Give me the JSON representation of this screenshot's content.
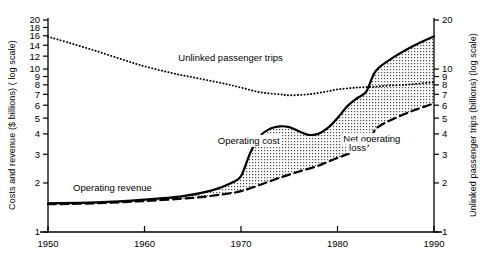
{
  "chart_data": {
    "type": "line",
    "title": "",
    "xlabel": "",
    "ylabel": "Costs and revenue ($ billions) ( log scale)",
    "y2label": "Unlinked passenger trips (billions) (log scale)",
    "grid": false,
    "legend_position": "inline-annotations",
    "xlim": [
      1950,
      1990
    ],
    "xticks": [
      1950,
      1960,
      1970,
      1980,
      1990
    ],
    "xtick_labels": [
      "1950",
      "1960",
      "1970",
      "1980",
      "1990"
    ],
    "yscale": "log",
    "ylim": [
      1,
      20
    ],
    "yticks": [
      1,
      2,
      3,
      4,
      5,
      6,
      7,
      8,
      9,
      10,
      12,
      14,
      16,
      18,
      20
    ],
    "ytick_labels": [
      "1",
      "2",
      "3",
      "4",
      "5",
      "6",
      "7",
      "8",
      "9",
      "10",
      "12",
      "14",
      "16",
      "18",
      "20"
    ],
    "y2scale": "log",
    "y2lim": [
      1,
      20
    ],
    "y2ticks": [
      1,
      2,
      3,
      4,
      5,
      6,
      7,
      8,
      9,
      10,
      20
    ],
    "y2tick_labels": [
      "1",
      "2",
      "3",
      "4",
      "5",
      "6",
      "7",
      "8",
      "9",
      "10",
      "20"
    ],
    "annotations": [
      {
        "text": "Unlinked passenger trips",
        "x": 1963.5,
        "y": 11.2
      },
      {
        "text": "Operating cost",
        "x": 1967.6,
        "y": 3.45
      },
      {
        "text": "Net operating",
        "x": 1980.6,
        "y": 3.55
      },
      {
        "text": "loss",
        "x": 1981.2,
        "y": 3.15
      },
      {
        "text": "Operating revenue",
        "x": 1952.6,
        "y": 1.78
      }
    ],
    "fill_label": "Net operating loss",
    "fill_between": [
      "Operating cost",
      "Operating revenue"
    ],
    "fill_style": "stippled",
    "series": [
      {
        "name": "Unlinked passenger trips",
        "style": "dotted",
        "axis": "right",
        "x": [
          1950,
          1952,
          1955,
          1958,
          1960,
          1963,
          1965,
          1968,
          1970,
          1972,
          1974,
          1975,
          1977,
          1979,
          1980,
          1982,
          1984,
          1985,
          1987,
          1989,
          1990
        ],
        "values": [
          15.8,
          14.6,
          12.9,
          11.3,
          10.4,
          9.4,
          8.9,
          8.2,
          7.7,
          7.2,
          7.0,
          6.9,
          7.0,
          7.3,
          7.5,
          7.7,
          7.8,
          7.9,
          8.0,
          8.2,
          8.3
        ]
      },
      {
        "name": "Operating cost",
        "style": "solid",
        "axis": "left",
        "x": [
          1950,
          1955,
          1960,
          1964,
          1967,
          1969,
          1970,
          1971,
          1972,
          1973,
          1974,
          1975,
          1976,
          1977,
          1978,
          1979,
          1980,
          1981,
          1982,
          1983,
          1984,
          1986,
          1988,
          1990
        ],
        "values": [
          1.5,
          1.52,
          1.58,
          1.66,
          1.8,
          2.0,
          2.2,
          3.1,
          3.9,
          4.3,
          4.45,
          4.4,
          4.15,
          3.95,
          4.0,
          4.35,
          5.0,
          5.9,
          6.6,
          7.3,
          9.8,
          12.0,
          14.0,
          15.9
        ]
      },
      {
        "name": "Operating revenue",
        "style": "dashed",
        "axis": "left",
        "x": [
          1950,
          1955,
          1960,
          1965,
          1968,
          1970,
          1972,
          1974,
          1976,
          1978,
          1980,
          1982,
          1983,
          1984,
          1986,
          1988,
          1990
        ],
        "values": [
          1.48,
          1.5,
          1.55,
          1.62,
          1.7,
          1.78,
          1.95,
          2.15,
          2.35,
          2.55,
          2.85,
          3.15,
          3.3,
          4.3,
          5.0,
          5.6,
          6.15
        ]
      }
    ]
  }
}
